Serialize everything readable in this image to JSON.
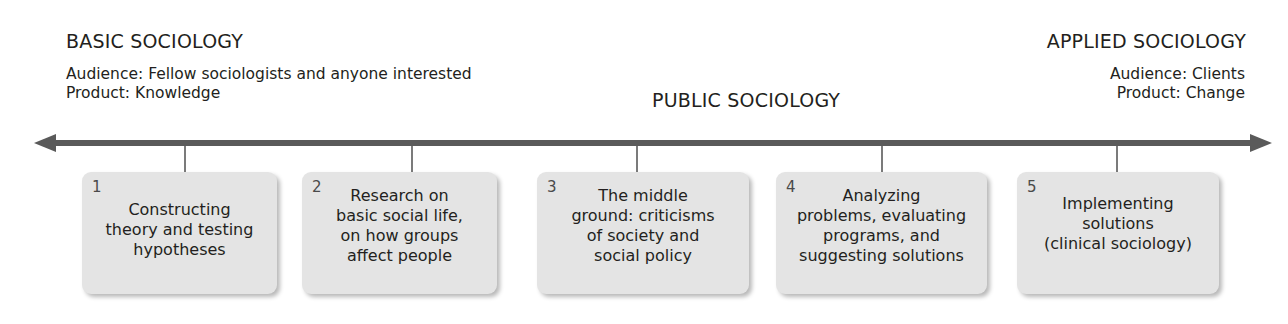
{
  "diagram": {
    "basic": {
      "heading": "BASIC SOCIOLOGY",
      "audience": "Audience: Fellow sociologists and anyone interested",
      "product": "Product: Knowledge"
    },
    "public": {
      "heading": "PUBLIC SOCIOLOGY"
    },
    "applied": {
      "heading": "APPLIED SOCIOLOGY",
      "audience": "Audience: Clients",
      "product": "Product: Change"
    },
    "axis": {
      "type": "double-headed-arrow",
      "color": "#5a5a5a"
    },
    "boxes": [
      {
        "number": "1",
        "lines": [
          "Constructing",
          "theory and testing",
          "hypotheses"
        ]
      },
      {
        "number": "2",
        "lines": [
          "Research on",
          "basic social life,",
          "on how groups",
          "affect people"
        ]
      },
      {
        "number": "3",
        "lines": [
          "The middle",
          "ground: criticisms",
          "of society and",
          "social policy"
        ]
      },
      {
        "number": "4",
        "lines": [
          "Analyzing",
          "problems, evaluating",
          "programs, and",
          "suggesting solutions"
        ]
      },
      {
        "number": "5",
        "lines": [
          "Implementing",
          "solutions",
          "(clinical sociology)"
        ]
      }
    ],
    "colors": {
      "box_fill": "#e4e4e4",
      "text": "#231f20",
      "arrow": "#5a5a5a"
    }
  }
}
